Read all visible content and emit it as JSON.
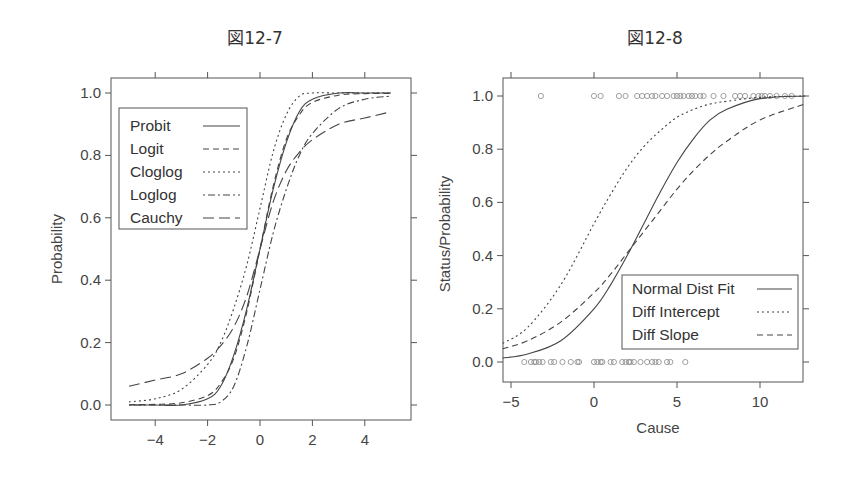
{
  "figures": [
    {
      "title": "図12-7"
    },
    {
      "title": "図12-8"
    }
  ],
  "chart_data": [
    {
      "type": "line",
      "title": "図12-7",
      "xlabel": "",
      "ylabel": "Probability",
      "xlim": [
        -5.5,
        5.9
      ],
      "ylim": [
        -0.05,
        1.05
      ],
      "xticks": [
        -4,
        -2,
        0,
        2,
        4
      ],
      "yticks": [
        "0.0",
        "0.2",
        "0.4",
        "0.6",
        "0.8",
        "1.0"
      ],
      "grid": false,
      "legend_position": "upper-left",
      "x": [
        -5,
        -4,
        -3,
        -2,
        -1.5,
        -1,
        -0.5,
        0,
        0.5,
        1,
        1.5,
        2,
        3,
        4,
        5
      ],
      "series": [
        {
          "name": "Probit",
          "style": "solid",
          "values": [
            0.0,
            0.0,
            0.0,
            0.02,
            0.06,
            0.16,
            0.31,
            0.5,
            0.69,
            0.84,
            0.94,
            0.98,
            1.0,
            1.0,
            1.0
          ]
        },
        {
          "name": "Logit",
          "style": "dashed",
          "values": [
            0.001,
            0.002,
            0.007,
            0.03,
            0.07,
            0.15,
            0.3,
            0.5,
            0.7,
            0.85,
            0.93,
            0.97,
            0.993,
            0.998,
            0.999
          ]
        },
        {
          "name": "Cloglog",
          "style": "dotted",
          "values": [
            0.01,
            0.02,
            0.05,
            0.13,
            0.2,
            0.31,
            0.45,
            0.63,
            0.81,
            0.93,
            0.99,
            1.0,
            1.0,
            1.0,
            1.0
          ]
        },
        {
          "name": "Loglog",
          "style": "dot-dash",
          "values": [
            0.0,
            0.0,
            0.0,
            0.0,
            0.01,
            0.06,
            0.19,
            0.37,
            0.55,
            0.69,
            0.8,
            0.87,
            0.95,
            0.98,
            0.99
          ]
        },
        {
          "name": "Cauchy",
          "style": "long-dash",
          "values": [
            0.06,
            0.08,
            0.1,
            0.15,
            0.19,
            0.25,
            0.35,
            0.5,
            0.65,
            0.75,
            0.81,
            0.85,
            0.9,
            0.92,
            0.94
          ]
        }
      ]
    },
    {
      "type": "line",
      "title": "図12-8",
      "xlabel": "Cause",
      "ylabel": "Status/Probability",
      "xlim": [
        -5.5,
        12.7
      ],
      "ylim": [
        -0.06,
        1.06
      ],
      "xticks": [
        -5,
        0,
        5,
        10
      ],
      "yticks": [
        "0.0",
        "0.2",
        "0.4",
        "0.6",
        "0.8",
        "1.0"
      ],
      "grid": false,
      "legend_position": "lower-right",
      "x": [
        -5.5,
        -4,
        -2,
        0,
        1,
        2,
        3,
        4,
        5,
        6,
        7,
        8,
        10,
        12.7
      ],
      "series": [
        {
          "name": "Normal Dist Fit",
          "style": "solid",
          "values": [
            0.015,
            0.03,
            0.08,
            0.2,
            0.29,
            0.4,
            0.52,
            0.64,
            0.75,
            0.84,
            0.91,
            0.95,
            0.99,
            1.0
          ]
        },
        {
          "name": "Diff Intercept",
          "style": "dotted",
          "values": [
            0.07,
            0.13,
            0.29,
            0.52,
            0.63,
            0.73,
            0.81,
            0.87,
            0.92,
            0.95,
            0.97,
            0.98,
            0.995,
            1.0
          ]
        },
        {
          "name": "Diff Slope",
          "style": "dashed",
          "values": [
            0.05,
            0.08,
            0.15,
            0.26,
            0.33,
            0.41,
            0.49,
            0.57,
            0.65,
            0.72,
            0.78,
            0.83,
            0.91,
            0.97
          ]
        }
      ],
      "points": {
        "name": "Status observations",
        "marker": "open-circle",
        "y0_x": [
          -4.2,
          -3.8,
          -3.6,
          -3.5,
          -3.3,
          -3.1,
          -2.6,
          -2.4,
          -1.9,
          -1.4,
          -1.0,
          -0.9,
          0.0,
          0.2,
          0.4,
          0.5,
          1.0,
          1.2,
          1.7,
          1.9,
          2.1,
          2.2,
          2.4,
          2.8,
          3.2,
          3.5,
          3.7,
          3.9,
          4.4,
          4.6,
          5.5
        ],
        "y1_x": [
          -3.2,
          0.0,
          0.4,
          1.5,
          1.9,
          2.6,
          2.9,
          3.2,
          3.5,
          3.7,
          4.1,
          4.4,
          4.8,
          5.0,
          5.2,
          5.4,
          5.7,
          5.9,
          6.1,
          6.4,
          6.6,
          7.2,
          7.8,
          8.5,
          8.8,
          9.1,
          9.6,
          9.9,
          10.1,
          10.3,
          10.6,
          11.0,
          11.5,
          11.9
        ]
      }
    }
  ]
}
